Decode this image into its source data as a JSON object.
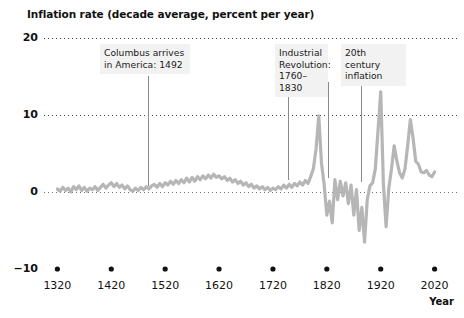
{
  "chart_data": {
    "type": "line",
    "title": "Inflation rate (decade average, percent per year)",
    "xlabel": "Year",
    "ylabel": "",
    "ylim": [
      -10,
      20
    ],
    "xlim": [
      1310,
      2030
    ],
    "grid": "dotted horizontal gridlines at 20, 10, 0",
    "legend": "none",
    "yticks": [
      20,
      10,
      0,
      -10
    ],
    "ytick_labels": [
      "20",
      "10",
      "0",
      "−10"
    ],
    "xticks": [
      1320,
      1420,
      1520,
      1620,
      1720,
      1820,
      1920,
      2020
    ],
    "xtick_labels": [
      "1320",
      "1420",
      "1520",
      "1620",
      "1720",
      "1820",
      "1920",
      "2020"
    ],
    "series": [
      {
        "name": "Inflation rate (decade average)",
        "color": "#b6b6b6",
        "x": [
          1320,
          1325,
          1330,
          1335,
          1340,
          1345,
          1350,
          1355,
          1360,
          1365,
          1370,
          1375,
          1380,
          1385,
          1390,
          1395,
          1400,
          1405,
          1410,
          1415,
          1420,
          1425,
          1430,
          1435,
          1440,
          1445,
          1450,
          1455,
          1460,
          1465,
          1470,
          1475,
          1480,
          1485,
          1490,
          1495,
          1500,
          1505,
          1510,
          1515,
          1520,
          1525,
          1530,
          1535,
          1540,
          1545,
          1550,
          1555,
          1560,
          1565,
          1570,
          1575,
          1580,
          1585,
          1590,
          1595,
          1600,
          1605,
          1610,
          1615,
          1620,
          1625,
          1630,
          1635,
          1640,
          1645,
          1650,
          1655,
          1660,
          1665,
          1670,
          1675,
          1680,
          1685,
          1690,
          1695,
          1700,
          1705,
          1710,
          1715,
          1720,
          1725,
          1730,
          1735,
          1740,
          1745,
          1750,
          1755,
          1760,
          1765,
          1770,
          1775,
          1780,
          1785,
          1790,
          1795,
          1800,
          1805,
          1810,
          1815,
          1820,
          1825,
          1830,
          1835,
          1840,
          1845,
          1850,
          1855,
          1860,
          1865,
          1870,
          1875,
          1880,
          1885,
          1890,
          1895,
          1900,
          1905,
          1910,
          1915,
          1920,
          1925,
          1930,
          1935,
          1940,
          1945,
          1950,
          1955,
          1960,
          1965,
          1970,
          1975,
          1980,
          1985,
          1990,
          1995,
          2000,
          2005,
          2010,
          2015,
          2020
        ],
        "y": [
          0.4,
          0.1,
          0.6,
          0.2,
          0.5,
          0.0,
          0.7,
          0.3,
          0.8,
          0.2,
          0.6,
          0.1,
          0.5,
          0.3,
          0.7,
          0.2,
          0.6,
          1.0,
          0.5,
          0.9,
          1.2,
          0.7,
          1.1,
          0.6,
          0.9,
          0.4,
          0.8,
          0.3,
          0.1,
          0.5,
          0.2,
          0.6,
          0.3,
          0.7,
          0.4,
          0.8,
          1.0,
          0.6,
          1.1,
          0.7,
          1.2,
          0.9,
          1.4,
          1.0,
          1.5,
          1.1,
          1.6,
          1.2,
          1.8,
          1.3,
          1.9,
          1.4,
          2.0,
          1.6,
          2.1,
          1.7,
          2.2,
          1.8,
          2.3,
          1.9,
          2.1,
          1.7,
          2.0,
          1.5,
          1.8,
          1.3,
          1.6,
          1.1,
          1.4,
          0.9,
          1.2,
          0.7,
          1.0,
          0.5,
          0.8,
          0.4,
          0.7,
          0.3,
          0.6,
          0.2,
          0.5,
          0.3,
          0.7,
          0.4,
          0.9,
          0.5,
          1.0,
          0.6,
          1.1,
          0.8,
          1.3,
          0.9,
          1.5,
          1.1,
          2.0,
          3.0,
          5.6,
          9.9,
          3.8,
          1.0,
          -3.0,
          -1.2,
          -4.0,
          1.6,
          -1.0,
          1.4,
          -0.5,
          1.2,
          -1.5,
          0.9,
          -3.0,
          0.3,
          -5.0,
          -2.0,
          -6.5,
          -1.0,
          0.8,
          1.2,
          3.0,
          8.0,
          13.0,
          1.0,
          -4.5,
          0.5,
          3.0,
          6.0,
          4.0,
          2.5,
          1.8,
          3.0,
          6.0,
          9.4,
          7.0,
          4.0,
          3.6,
          2.6,
          2.5,
          2.8,
          2.2,
          2.0,
          2.6
        ],
        "description": "Decade-average inflation rate, near zero from 1320 to ~1700, rising volatility after 1750, large swings 1790-1930, 20th century peak ~13% near 1920 and ~9.4% near 1975-1980, settling near 2-3% by 2020"
      }
    ],
    "annotations": [
      {
        "id": "columbus",
        "text": "Columbus arrives\nin America: 1492",
        "box_x": 100,
        "box_y": 44,
        "box_width": 90,
        "leader_lines": [
          {
            "x": 148,
            "y1": 76,
            "y2": 186
          }
        ]
      },
      {
        "id": "industrial-revolution",
        "text": "Industrial\nRevolution:\n1760–1830",
        "box_x": 275,
        "box_y": 44,
        "box_width": 53,
        "leader_lines": [
          {
            "x": 288,
            "y1": 82,
            "y2": 180
          },
          {
            "x": 328,
            "y1": 82,
            "y2": 178
          }
        ]
      },
      {
        "id": "20th-century-inflation",
        "text": "20th century\ninflation",
        "box_x": 341,
        "box_y": 44,
        "box_width": 65,
        "leader_lines": [
          {
            "x": 361,
            "y1": 70,
            "y2": 182
          }
        ]
      }
    ]
  },
  "axis": {
    "year_label": "Year"
  },
  "colors": {
    "line": "#b6b6b6",
    "grid": "#3a3a3a",
    "axis_text": "#111111",
    "annotation_bg": "#f2f2f2",
    "leader_line": "#8a8a8a"
  }
}
